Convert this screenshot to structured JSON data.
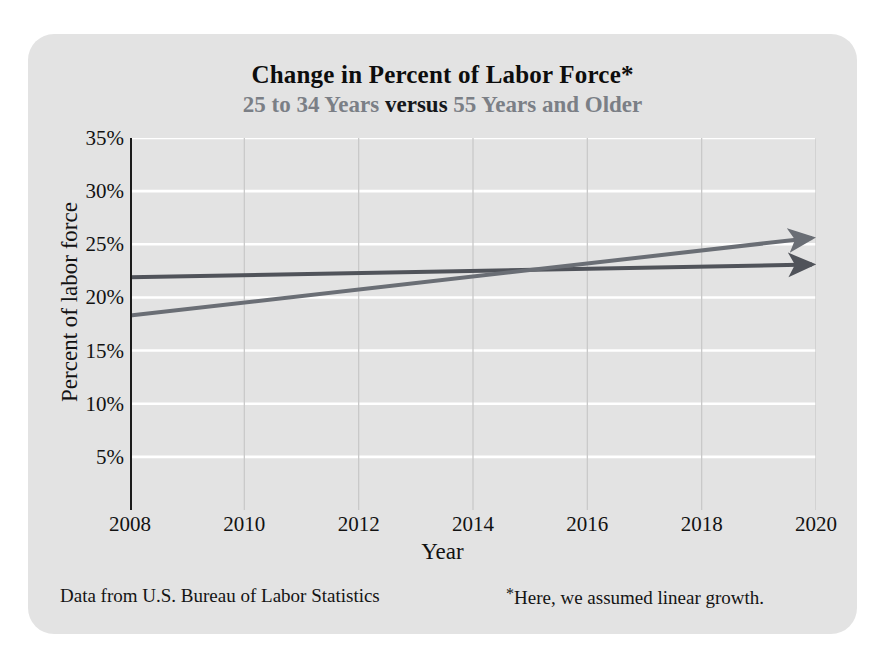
{
  "card": {
    "background_color": "#e3e3e3"
  },
  "titles": {
    "main": "Change in Percent of Labor Force*",
    "sub_part1": "25 to 34 Years",
    "sub_part2": "versus",
    "sub_part3": "55 Years and Older"
  },
  "footer": {
    "source": "Data from U.S. Bureau of Labor Statistics",
    "note_star": "*",
    "note": "Here, we assumed linear growth."
  },
  "chart_data": {
    "type": "line",
    "title": "Change in Percent of Labor Force*",
    "subtitle": "25 to 34 Years versus 55 Years and Older",
    "xlabel": "Year",
    "ylabel": "Percent of labor force",
    "xlim": [
      2008,
      2020
    ],
    "ylim": [
      0,
      35
    ],
    "xticks": [
      2008,
      2010,
      2012,
      2014,
      2016,
      2018,
      2020
    ],
    "xticklabels": [
      "2008",
      "2010",
      "2012",
      "2014",
      "2016",
      "2018",
      "2020"
    ],
    "yticks": [
      5,
      10,
      15,
      20,
      25,
      30,
      35
    ],
    "yticklabels": [
      "5%",
      "10%",
      "15%",
      "20%",
      "25%",
      "30%",
      "35%"
    ],
    "grid": {
      "horizontal": true,
      "horizontal_color": "#ffffff",
      "vertical": true,
      "vertical_color": "#c9c9c9"
    },
    "legend": "none",
    "annotations": [
      "Both trend lines are drawn with arrowheads at the 2020 end.",
      "The two lines cross at approximately 2014.7 at about 22.6%."
    ],
    "x": [
      2008,
      2020
    ],
    "series": [
      {
        "name": "25 to 34 Years",
        "color": "#50535a",
        "values": [
          21.9,
          23.1
        ],
        "arrow_end": true
      },
      {
        "name": "55 Years and Older",
        "color": "#6a6e75",
        "values": [
          18.3,
          25.6
        ],
        "arrow_end": true
      }
    ]
  }
}
